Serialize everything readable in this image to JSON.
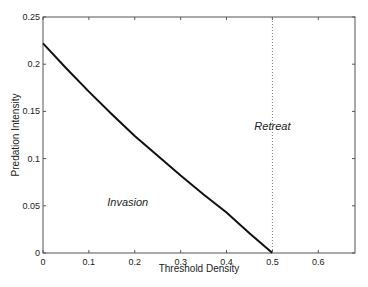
{
  "chart_data": {
    "type": "line",
    "title": "",
    "xlabel": "Threshold Density",
    "ylabel": "Predation Intensity",
    "xlim": [
      0,
      0.68
    ],
    "ylim": [
      0,
      0.25
    ],
    "grid": false,
    "xticks": [
      "0",
      "0.1",
      "0.2",
      "0.3",
      "0.4",
      "0.5",
      "0.6"
    ],
    "yticks": [
      "0",
      "0.05",
      "0.1",
      "0.15",
      "0.2",
      "0.25"
    ],
    "series": [
      {
        "name": "boundary",
        "style": "solid",
        "x": [
          0,
          0.05,
          0.1,
          0.15,
          0.2,
          0.25,
          0.3,
          0.35,
          0.4,
          0.45,
          0.5
        ],
        "y": [
          0.222,
          0.196,
          0.171,
          0.147,
          0.124,
          0.103,
          0.082,
          0.062,
          0.043,
          0.021,
          0.0
        ]
      },
      {
        "name": "threshold",
        "style": "dotted",
        "x": [
          0.5,
          0.5
        ],
        "y": [
          0,
          0.25
        ]
      }
    ],
    "annotations": [
      {
        "text": "Invasion",
        "x": 0.14,
        "y": 0.05
      },
      {
        "text": "Retreat",
        "x": 0.5,
        "y": 0.13
      }
    ]
  }
}
